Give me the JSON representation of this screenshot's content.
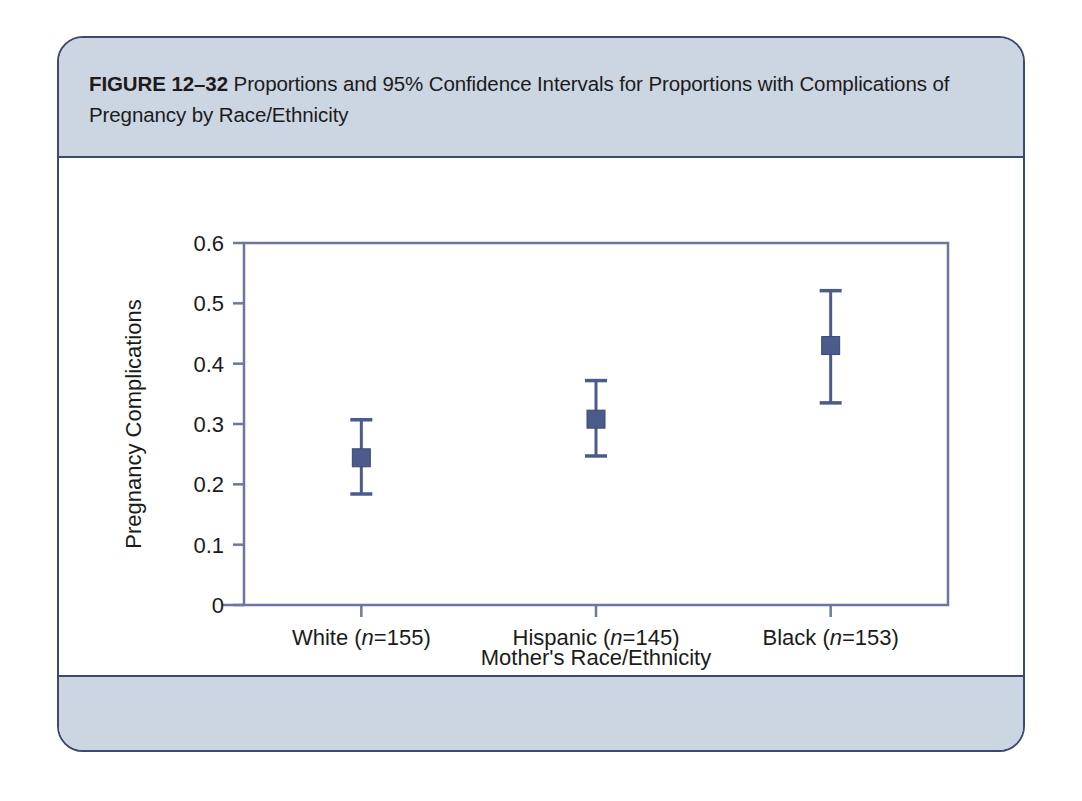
{
  "figure": {
    "label": "FIGURE 12–32",
    "caption": "Proportions and 95% Confidence Intervals for Proportions with Complications of Pregnancy by Race/Ethnicity"
  },
  "colors": {
    "panel_border": "#3c4a6b",
    "band_fill": "#ccd5e2",
    "axis_line": "#6b77a0",
    "marker_fill": "#4a5b8c",
    "marker_stroke": "#3c4a6b",
    "text": "#1b1b1b",
    "plot_background": "#ffffff"
  },
  "chart_data": {
    "type": "scatter",
    "title": "",
    "xlabel": "Mother's Race/Ethnicity",
    "ylabel": "Pregnancy Complications",
    "ylim": [
      0,
      0.6
    ],
    "yticks": [
      "0",
      "0.1",
      "0.2",
      "0.3",
      "0.4",
      "0.5",
      "0.6"
    ],
    "ytick_values": [
      0,
      0.1,
      0.2,
      0.3,
      0.4,
      0.5,
      0.6
    ],
    "grid": false,
    "legend": "none",
    "error_bars": "95% confidence interval",
    "categories": [
      "White (n=155)",
      "Hispanic (n=145)",
      "Black (n=153)"
    ],
    "category_parts": [
      {
        "name": "White",
        "n_prefix": " (",
        "n_italic": "n",
        "n_value": "=155)"
      },
      {
        "name": "Hispanic",
        "n_prefix": " (",
        "n_italic": "n",
        "n_value": "=145)"
      },
      {
        "name": "Black",
        "n_prefix": " (",
        "n_italic": "n",
        "n_value": "=153)"
      }
    ],
    "values": [
      0.244,
      0.308,
      0.43
    ],
    "ci_lower": [
      0.184,
      0.247,
      0.335
    ],
    "ci_upper": [
      0.307,
      0.372,
      0.521
    ],
    "points": [
      {
        "category": "White (n=155)",
        "n": 155,
        "proportion": 0.244,
        "ci_lower": 0.184,
        "ci_upper": 0.307
      },
      {
        "category": "Hispanic (n=145)",
        "n": 145,
        "proportion": 0.308,
        "ci_lower": 0.247,
        "ci_upper": 0.372
      },
      {
        "category": "Black (n=153)",
        "n": 153,
        "proportion": 0.43,
        "ci_lower": 0.335,
        "ci_upper": 0.521
      }
    ]
  }
}
